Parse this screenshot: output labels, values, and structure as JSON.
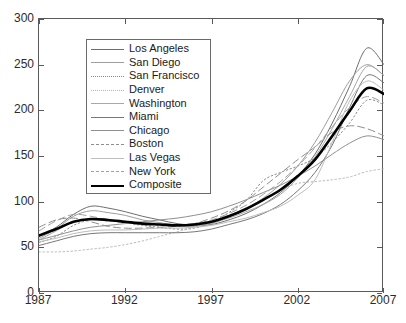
{
  "chart_data": {
    "type": "line",
    "title": "",
    "xlabel": "",
    "ylabel": "",
    "xlim": [
      1987,
      2007
    ],
    "ylim": [
      0,
      300
    ],
    "xticks": [
      1987,
      1992,
      1997,
      2002,
      2007
    ],
    "xtick_labels": [
      "1987",
      "1992",
      "1997",
      "2002",
      "2007"
    ],
    "yticks": [
      0,
      50,
      100,
      150,
      200,
      250,
      300
    ],
    "ytick_labels": [
      "0",
      "50",
      "100",
      "150",
      "200",
      "250",
      "300"
    ],
    "grid": false,
    "legend_position": "upper left",
    "x": [
      1987,
      1988,
      1989,
      1990,
      1991,
      1992,
      1993,
      1994,
      1995,
      1996,
      1997,
      1998,
      1999,
      2000,
      2001,
      2002,
      2003,
      2004,
      2005,
      2006,
      2007
    ],
    "series": [
      {
        "name": "Los Angeles",
        "color": "#6e6e6e",
        "style": "solid",
        "width": 1,
        "values": [
          62,
          72,
          86,
          95,
          93,
          89,
          84,
          80,
          76,
          74,
          75,
          80,
          87,
          97,
          110,
          128,
          152,
          186,
          226,
          268,
          250
        ]
      },
      {
        "name": "San Diego",
        "color": "#9e9e9e",
        "style": "solid",
        "width": 1,
        "values": [
          60,
          70,
          84,
          90,
          88,
          85,
          80,
          77,
          74,
          73,
          76,
          83,
          92,
          104,
          119,
          139,
          165,
          198,
          232,
          250,
          238
        ]
      },
      {
        "name": "San Francisco",
        "color": "#8a8a8a",
        "style": "dotted",
        "width": 1,
        "values": [
          55,
          62,
          74,
          80,
          79,
          77,
          74,
          72,
          70,
          71,
          77,
          88,
          101,
          123,
          132,
          139,
          148,
          165,
          186,
          211,
          206
        ]
      },
      {
        "name": "Denver",
        "color": "#b5b5b5",
        "style": "dotted",
        "width": 1,
        "values": [
          45,
          45,
          46,
          48,
          50,
          53,
          57,
          62,
          67,
          72,
          78,
          85,
          93,
          103,
          113,
          120,
          122,
          124,
          127,
          133,
          136
        ]
      },
      {
        "name": "Washington",
        "color": "#a8a8a8",
        "style": "solid",
        "width": 1,
        "values": [
          58,
          68,
          78,
          80,
          79,
          78,
          77,
          76,
          75,
          75,
          77,
          82,
          89,
          97,
          108,
          126,
          149,
          180,
          215,
          248,
          238
        ]
      },
      {
        "name": "Miami",
        "color": "#787878",
        "style": "solid",
        "width": 1,
        "values": [
          52,
          57,
          62,
          65,
          66,
          66,
          66,
          66,
          66,
          67,
          70,
          75,
          80,
          87,
          97,
          112,
          132,
          162,
          203,
          238,
          230
        ]
      },
      {
        "name": "Chicago",
        "color": "#909090",
        "style": "solid",
        "width": 1,
        "values": [
          58,
          63,
          68,
          72,
          74,
          76,
          78,
          80,
          82,
          85,
          89,
          95,
          102,
          110,
          118,
          128,
          139,
          152,
          164,
          172,
          168
        ]
      },
      {
        "name": "Boston",
        "color": "#8e8e8e",
        "style": "dashed",
        "width": 1,
        "values": [
          72,
          80,
          82,
          78,
          73,
          71,
          71,
          72,
          73,
          76,
          82,
          90,
          101,
          116,
          131,
          146,
          160,
          176,
          183,
          180,
          172
        ]
      },
      {
        "name": "Las Vegas",
        "color": "#bdbdbd",
        "style": "solid",
        "width": 1,
        "values": [
          56,
          60,
          65,
          68,
          69,
          69,
          70,
          71,
          71,
          72,
          74,
          78,
          82,
          88,
          95,
          107,
          124,
          165,
          210,
          232,
          222
        ]
      },
      {
        "name": "New York",
        "color": "#a0a0a0",
        "style": "dashed",
        "width": 1,
        "values": [
          68,
          79,
          86,
          84,
          80,
          77,
          75,
          75,
          75,
          76,
          80,
          87,
          96,
          108,
          122,
          139,
          159,
          182,
          203,
          215,
          208
        ]
      },
      {
        "name": "Composite",
        "color": "#000000",
        "style": "solid",
        "width": 2.6,
        "values": [
          63,
          70,
          78,
          81,
          80,
          78,
          76,
          75,
          74,
          75,
          78,
          84,
          92,
          102,
          113,
          128,
          146,
          172,
          199,
          224,
          218
        ]
      }
    ]
  },
  "legend": {
    "entries": [
      {
        "label": "Los Angeles"
      },
      {
        "label": "San Diego"
      },
      {
        "label": "San Francisco"
      },
      {
        "label": "Denver"
      },
      {
        "label": "Washington"
      },
      {
        "label": "Miami"
      },
      {
        "label": "Chicago"
      },
      {
        "label": "Boston"
      },
      {
        "label": "Las Vegas"
      },
      {
        "label": "New York"
      },
      {
        "label": "Composite"
      }
    ]
  },
  "axes": {
    "frame_color": "#5a5a5a",
    "text_color": "#2b2b2b"
  }
}
